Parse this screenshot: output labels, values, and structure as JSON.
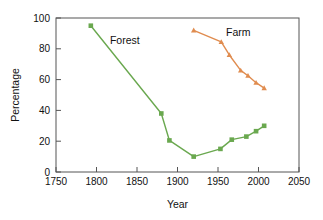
{
  "chart_data": {
    "type": "line",
    "title": "",
    "xlabel": "Year",
    "ylabel": "Percentage",
    "xlim": [
      1750,
      2050
    ],
    "ylim": [
      0,
      100
    ],
    "xticks": [
      1750,
      1800,
      1850,
      1900,
      1950,
      2000,
      2050
    ],
    "yticks": [
      0,
      20,
      40,
      60,
      80,
      100
    ],
    "grid": false,
    "legend_position": "inline-annotations",
    "series": [
      {
        "name": "Forest",
        "color": "#6aa84f",
        "marker": "square",
        "label_text": "Forest",
        "label_x": 1835,
        "label_y": 83,
        "points": [
          {
            "x": 1793,
            "y": 95
          },
          {
            "x": 1880,
            "y": 38
          },
          {
            "x": 1890,
            "y": 20.5
          },
          {
            "x": 1920,
            "y": 10
          },
          {
            "x": 1953,
            "y": 15
          },
          {
            "x": 1967,
            "y": 21
          },
          {
            "x": 1985,
            "y": 23
          },
          {
            "x": 1997,
            "y": 26.5
          },
          {
            "x": 2007,
            "y": 30
          }
        ]
      },
      {
        "name": "Farm",
        "color": "#e08c4f",
        "marker": "triangle",
        "label_text": "Farm",
        "label_x": 1975,
        "label_y": 88,
        "points": [
          {
            "x": 1920,
            "y": 92
          },
          {
            "x": 1954,
            "y": 84.5
          },
          {
            "x": 1964,
            "y": 76
          },
          {
            "x": 1978,
            "y": 66
          },
          {
            "x": 1987,
            "y": 62.5
          },
          {
            "x": 1997,
            "y": 58
          },
          {
            "x": 2007,
            "y": 54.5
          }
        ]
      }
    ],
    "axis_color": "#555555",
    "text_color": "#111111",
    "background": "#ffffff"
  }
}
